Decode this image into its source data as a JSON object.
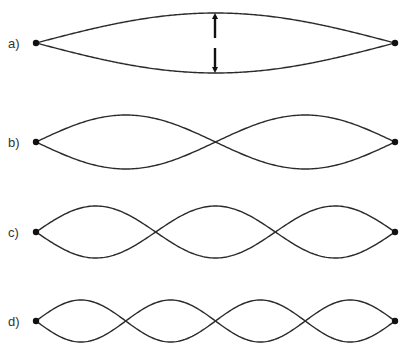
{
  "diagram": {
    "stroke_color": "#2a2a2a",
    "x_start": 36,
    "x_end": 395,
    "panels": [
      {
        "id": "a",
        "label": "a)",
        "center_y": 43,
        "amplitude": 30,
        "loops": 1,
        "arrows": true
      },
      {
        "id": "b",
        "label": "b)",
        "center_y": 142,
        "amplitude": 27,
        "loops": 2,
        "arrows": false
      },
      {
        "id": "c",
        "label": "c)",
        "center_y": 232,
        "amplitude": 26,
        "loops": 3,
        "arrows": false
      },
      {
        "id": "d",
        "label": "d)",
        "center_y": 321,
        "amplitude": 21,
        "loops": 4,
        "arrows": false
      }
    ],
    "arrows": {
      "x": 215,
      "up": {
        "from": 38,
        "to": 16
      },
      "down": {
        "from": 48,
        "to": 70
      }
    }
  }
}
